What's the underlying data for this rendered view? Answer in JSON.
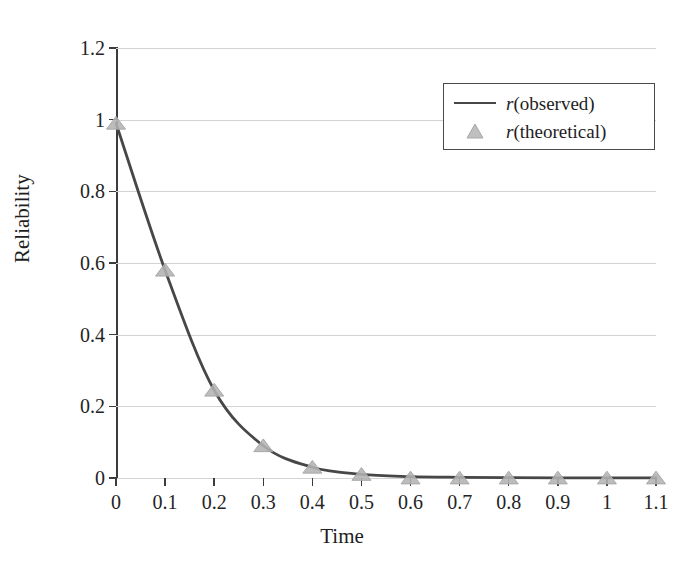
{
  "chart_data": {
    "type": "line",
    "title": "",
    "xlabel": "Time",
    "ylabel": "Reliability",
    "xlim": [
      0,
      1.1
    ],
    "ylim": [
      0,
      1.2
    ],
    "grid": true,
    "grid_axis": "y",
    "legend_position": "top-right",
    "x": [
      0,
      0.1,
      0.2,
      0.3,
      0.4,
      0.5,
      0.6,
      0.7,
      0.8,
      0.9,
      1,
      1.1
    ],
    "xtick_labels": [
      "0",
      "0.1",
      "0.2",
      "0.3",
      "0.4",
      "0.5",
      "0.6",
      "0.7",
      "0.8",
      "0.9",
      "1",
      "1.1"
    ],
    "ytick_values": [
      0,
      0.2,
      0.4,
      0.6,
      0.8,
      1,
      1.2
    ],
    "ytick_labels": [
      "0",
      "0.2",
      "0.4",
      "0.6",
      "0.8",
      "1",
      "1.2"
    ],
    "series": [
      {
        "name": "r(observed)",
        "style": "line",
        "color": "#474747",
        "values": [
          0.99,
          0.58,
          0.245,
          0.09,
          0.03,
          0.01,
          0.004,
          0.002,
          0.001,
          0.0005,
          0.0002,
          0.0001
        ]
      },
      {
        "name": "r(theoretical)",
        "style": "marker",
        "marker": "triangle",
        "color": "#b3b3b3",
        "values": [
          0.99,
          0.58,
          0.245,
          0.09,
          0.03,
          0.01,
          0.0,
          0.0,
          0.0,
          0.0,
          0.0,
          0.0
        ]
      }
    ]
  },
  "legend": {
    "items": [
      {
        "prefix": "r",
        "suffix": "(observed)",
        "key": "line"
      },
      {
        "prefix": "r",
        "suffix": "(theoretical)",
        "key": "triangle"
      }
    ]
  },
  "axes": {
    "x_title": "Time",
    "y_title": "Reliability"
  }
}
